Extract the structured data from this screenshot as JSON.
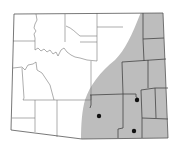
{
  "map": {
    "title": "Wyoming county map",
    "region": "Wyoming",
    "shaded_area": {
      "description": "Eastern and southeastern portion shaded",
      "color": "#bdbdbd"
    },
    "markers": [
      {
        "name": "dot-1",
        "x": 137,
        "y": 100
      },
      {
        "name": "dot-2",
        "x": 99,
        "y": 116
      },
      {
        "name": "dot-3",
        "x": 134,
        "y": 131
      }
    ],
    "colors": {
      "background": "#ffffff",
      "land": "#ffffff",
      "shade": "#bdbdbd",
      "border": "#555555",
      "marker": "#111111"
    }
  }
}
